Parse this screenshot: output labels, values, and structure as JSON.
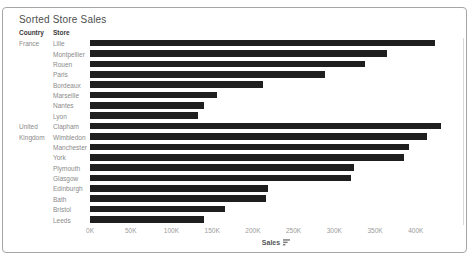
{
  "window": {
    "title": "Sorted Store Sales"
  },
  "colors": {
    "bar": "#1f1f1f",
    "title_text": "#4e4e4e",
    "header_text": "#3a3a3a",
    "row_label_text": "#8a8a8a",
    "tick_text": "#9b9b9b",
    "axis_title_text": "#555555",
    "card_border": "#a6a6a6",
    "panel_border": "#d9d9d9",
    "background": "#ffffff"
  },
  "columns": {
    "country_header": "Country",
    "store_header": "Store"
  },
  "axis": {
    "title": "Sales",
    "sort_indicator": "descending",
    "tick_labels": [
      "0K",
      "50K",
      "100K",
      "150K",
      "200K",
      "250K",
      "300K",
      "350K",
      "400K"
    ],
    "tick_values_k": [
      0,
      50,
      100,
      150,
      200,
      250,
      300,
      350,
      400
    ],
    "axis_max_k": 458
  },
  "chart_data": {
    "type": "bar",
    "orientation": "horizontal",
    "title": "Sorted Store Sales",
    "xlabel": "Sales",
    "ylabel": "Country / Store",
    "xlim": [
      0,
      458000
    ],
    "sort": "descending within country",
    "unit": "K (thousands)",
    "groups": [
      {
        "country": "France",
        "country_lines": [
          "France"
        ],
        "stores": [
          {
            "store": "Lille",
            "sales_k": 423
          },
          {
            "store": "Montpellier",
            "sales_k": 365
          },
          {
            "store": "Rouen",
            "sales_k": 337
          },
          {
            "store": "Paris",
            "sales_k": 289
          },
          {
            "store": "Bordeaux",
            "sales_k": 212
          },
          {
            "store": "Marseille",
            "sales_k": 156
          },
          {
            "store": "Nantes",
            "sales_k": 140
          },
          {
            "store": "Lyon",
            "sales_k": 132
          }
        ]
      },
      {
        "country": "United Kingdom",
        "country_lines": [
          "United",
          "Kingdom"
        ],
        "stores": [
          {
            "store": "Clapham",
            "sales_k": 431
          },
          {
            "store": "Wimbledon",
            "sales_k": 414
          },
          {
            "store": "Manchester",
            "sales_k": 392
          },
          {
            "store": "York",
            "sales_k": 386
          },
          {
            "store": "Plymouth",
            "sales_k": 324
          },
          {
            "store": "Glasgow",
            "sales_k": 321
          },
          {
            "store": "Edinburgh",
            "sales_k": 219
          },
          {
            "store": "Bath",
            "sales_k": 216
          },
          {
            "store": "Bristol",
            "sales_k": 166
          },
          {
            "store": "Leeds",
            "sales_k": 140
          }
        ]
      }
    ]
  }
}
